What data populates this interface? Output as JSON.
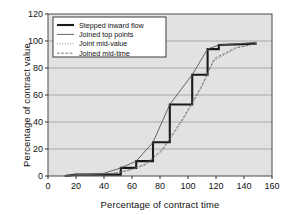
{
  "chart_data": {
    "type": "line",
    "title": "",
    "xlabel": "Percentage of contract time",
    "ylabel": "Percentage of contract value",
    "xlim": [
      0,
      160
    ],
    "ylim": [
      0,
      120
    ],
    "xticks": [
      0,
      20,
      40,
      60,
      80,
      100,
      120,
      140,
      160
    ],
    "yticks": [
      0,
      20,
      40,
      60,
      80,
      100,
      120
    ],
    "grid": "horizontal",
    "legend_position": "upper-left-inside",
    "plot_background": "#e2e2e2",
    "series": [
      {
        "name": "Stepped inward flow",
        "style": "solid-thick",
        "color": "#1a1a1a",
        "step": "post",
        "x": [
          12,
          20,
          52,
          52,
          63,
          63,
          75,
          75,
          87,
          87,
          103,
          103,
          114,
          114,
          122,
          122,
          149
        ],
        "y": [
          0,
          1,
          1,
          6,
          6,
          11,
          11,
          25,
          25,
          53,
          53,
          75,
          75,
          94,
          94,
          97,
          98
        ]
      },
      {
        "name": "Joined top points",
        "style": "solid-thin",
        "color": "#555555",
        "x": [
          12,
          20,
          40,
          52,
          63,
          75,
          87,
          103,
          114,
          122,
          149
        ],
        "y": [
          0,
          1,
          2,
          6,
          11,
          25,
          53,
          75,
          94,
          97,
          99
        ]
      },
      {
        "name": "Joint mid-value",
        "style": "dotted",
        "color": "#777777",
        "x": [
          12,
          25,
          45,
          58,
          69,
          81,
          95,
          109,
          118,
          135,
          149
        ],
        "y": [
          0,
          1,
          2,
          4,
          8,
          18,
          39,
          64,
          85,
          95,
          98
        ]
      },
      {
        "name": "Joined mid-time",
        "style": "dashed",
        "color": "#666666",
        "x": [
          12,
          28,
          48,
          60,
          70,
          82,
          96,
          110,
          119,
          134,
          149
        ],
        "y": [
          0,
          1,
          2,
          5,
          9,
          20,
          42,
          67,
          87,
          95,
          98
        ]
      }
    ],
    "legend_entries": [
      {
        "label": "Stepped inward flow",
        "style": "solid-thick"
      },
      {
        "label": "Joined top points",
        "style": "solid-thin"
      },
      {
        "label": "Joint mid-value",
        "style": "dotted"
      },
      {
        "label": "Joined mid-time",
        "style": "dashed"
      }
    ]
  }
}
